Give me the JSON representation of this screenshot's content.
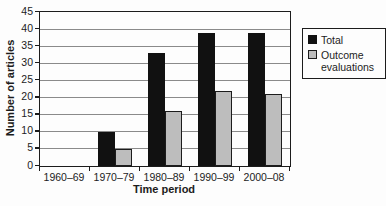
{
  "chart_data": {
    "type": "bar",
    "title": "",
    "xlabel": "Time period",
    "ylabel": "Number of articles",
    "categories": [
      "1960–69",
      "1970–79",
      "1980–89",
      "1990–99",
      "2000–08"
    ],
    "series": [
      {
        "name": "Total",
        "color": "#111111",
        "border": "#111111",
        "values": [
          0,
          10,
          33,
          39,
          39
        ]
      },
      {
        "name": "Outcome evaluations",
        "color": "#bdbdbd",
        "border": "#1c1c1c",
        "values": [
          0,
          5,
          16,
          22,
          21
        ]
      }
    ],
    "ylim": [
      0,
      45
    ],
    "yticks": [
      0,
      5,
      10,
      15,
      20,
      25,
      30,
      35,
      40,
      45
    ],
    "grid": true,
    "gridline_color": "#8a8a8a",
    "frame_color": "#1c1c1c",
    "legend_position": "right"
  }
}
